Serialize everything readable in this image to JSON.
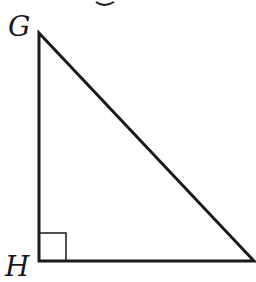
{
  "diagram": {
    "type": "right-triangle",
    "vertices": {
      "G": {
        "label": "G"
      },
      "H": {
        "label": "H"
      }
    },
    "right_angle_at": "H",
    "stroke_color": "#1a1a1a",
    "background": "#ffffff"
  }
}
